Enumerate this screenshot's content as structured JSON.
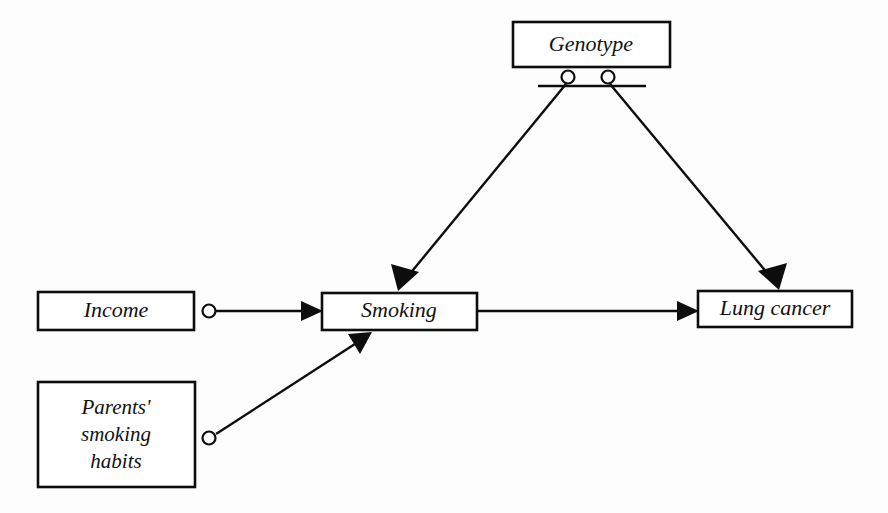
{
  "figure": {
    "background_color": "#fdfdfd",
    "ink_color": "#0d0d0d",
    "type": "causal-path-diagram"
  },
  "nodes": {
    "genotype": {
      "label": "Genotype",
      "x": 513,
      "y": 22,
      "width": 157,
      "height": 45
    },
    "income": {
      "label": "Income",
      "x": 38,
      "y": 292,
      "width": 156,
      "height": 38
    },
    "parents": {
      "label_line1": "Parents'",
      "label_line2": "smoking",
      "label_line3": "habits",
      "x": 38,
      "y": 382,
      "width": 157,
      "height": 105
    },
    "smoking": {
      "label": "Smoking",
      "x": 322,
      "y": 293,
      "width": 155,
      "height": 37
    },
    "lung_cancer": {
      "label": "Lung cancer",
      "x": 698,
      "y": 291,
      "width": 154,
      "height": 36
    }
  },
  "fork": {
    "bar_x1": 538,
    "bar_x2": 646,
    "bar_y": 86,
    "circle_left_cx": 568,
    "circle_right_cx": 608,
    "circle_cy": 77,
    "circle_r": 6.5
  },
  "edges": [
    {
      "name": "genotype-to-smoking",
      "from": "genotype",
      "to": "smoking",
      "x1": 566,
      "y1": 84,
      "x2": 398,
      "y2": 289,
      "has_origin_circle": false
    },
    {
      "name": "genotype-to-lung-cancer",
      "from": "genotype",
      "to": "lung_cancer",
      "x1": 610,
      "y1": 84,
      "x2": 779,
      "y2": 288,
      "has_origin_circle": false
    },
    {
      "name": "income-to-smoking",
      "from": "income",
      "to": "smoking",
      "x1": 216,
      "y1": 311,
      "x2": 321,
      "y2": 311,
      "has_origin_circle": true,
      "circle_cx": 209,
      "circle_cy": 311,
      "circle_r": 6.5
    },
    {
      "name": "parents-to-smoking",
      "from": "parents",
      "to": "smoking",
      "x1": 216,
      "y1": 434,
      "x2": 371,
      "y2": 333,
      "has_origin_circle": true,
      "circle_cx": 209,
      "circle_cy": 438,
      "circle_r": 6.5
    },
    {
      "name": "smoking-to-lung-cancer",
      "from": "smoking",
      "to": "lung_cancer",
      "x1": 478,
      "y1": 311,
      "x2": 697,
      "y2": 311,
      "has_origin_circle": false
    }
  ]
}
